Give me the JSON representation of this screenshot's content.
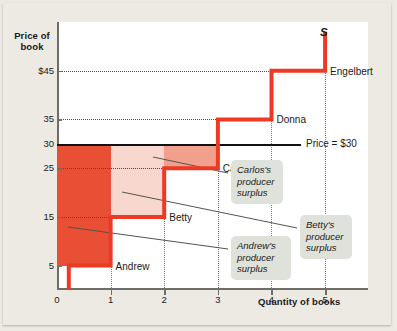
{
  "chart_data": {
    "type": "line",
    "title": "",
    "xlabel": "Quantity of books",
    "ylabel": "Price of book",
    "xlim": [
      0,
      5.8
    ],
    "ylim": [
      0,
      55
    ],
    "grid": true,
    "legend_position": "none",
    "x_ticks": [
      "0",
      "1",
      "2",
      "3",
      "4",
      "5"
    ],
    "x_tick_values": [
      0,
      1,
      2,
      3,
      4,
      5
    ],
    "y_ticks": [
      "5",
      "15",
      "25",
      "30",
      "35",
      "$45"
    ],
    "y_tick_values": [
      5,
      15,
      25,
      30,
      35,
      45
    ],
    "series": [
      {
        "name": "S",
        "type": "step-supply",
        "color": "#EE3A24",
        "points": [
          {
            "seller": "Andrew",
            "quantity": 1,
            "price": 5
          },
          {
            "seller": "Betty",
            "quantity": 2,
            "price": 15
          },
          {
            "seller": "Carlos",
            "quantity": 3,
            "price": 25
          },
          {
            "seller": "Donna",
            "quantity": 4,
            "price": 35
          },
          {
            "seller": "Engelbert",
            "quantity": 5,
            "price": 45
          }
        ]
      }
    ],
    "market_price": {
      "label": "Price = $30",
      "value": 30,
      "color": "#111111"
    },
    "shaded_regions": [
      {
        "name": "Andrew's producer surplus",
        "x0": 0,
        "x1": 1,
        "y0": 5,
        "y1": 30,
        "color": "#E94F35"
      },
      {
        "name": "Betty's producer surplus",
        "x0": 1,
        "x1": 2,
        "y0": 15,
        "y1": 30,
        "color": "#F7D7CE"
      },
      {
        "name": "Carlos's producer surplus",
        "x0": 2,
        "x1": 3,
        "y0": 25,
        "y1": 30,
        "color": "#F1A08E"
      }
    ]
  },
  "axes": {
    "y_title": "Price of\nbook",
    "x_title": "Quantity of books"
  },
  "ticks": {
    "y": [
      {
        "label": "$45",
        "value": 45
      },
      {
        "label": "35",
        "value": 35
      },
      {
        "label": "30",
        "value": 30
      },
      {
        "label": "25",
        "value": 25
      },
      {
        "label": "15",
        "value": 15
      },
      {
        "label": "5",
        "value": 5
      }
    ],
    "x": [
      {
        "label": "0",
        "value": 0
      },
      {
        "label": "1",
        "value": 1
      },
      {
        "label": "2",
        "value": 2
      },
      {
        "label": "3",
        "value": 3
      },
      {
        "label": "4",
        "value": 4
      },
      {
        "label": "5",
        "value": 5
      }
    ]
  },
  "curve_labels": {
    "supply": "S",
    "andrew": "Andrew",
    "betty": "Betty",
    "carlos": "Carlos",
    "donna": "Donna",
    "engelbert": "Engelbert",
    "price_line": "Price = $30"
  },
  "callouts": [
    {
      "id": "carlos",
      "text": "Carlos's\nproducer\nsurplus"
    },
    {
      "id": "betty",
      "text": "Betty's\nproducer\nsurplus"
    },
    {
      "id": "andrew",
      "text": "Andrew's\nproducer\nsurplus"
    }
  ],
  "colors": {
    "background": "#EDEAE3",
    "plot_bg": "#FFFFFF",
    "supply_curve": "#EE3A24",
    "price_line": "#111111",
    "andrew_fill": "#E94F35",
    "betty_fill": "#F7D7CE",
    "carlos_fill": "#F1A08E",
    "callout_bg": "#DFE2DA",
    "axis": "#6E6E68",
    "grid_h": "#4A4A46",
    "grid_v": "#8E6A62"
  }
}
